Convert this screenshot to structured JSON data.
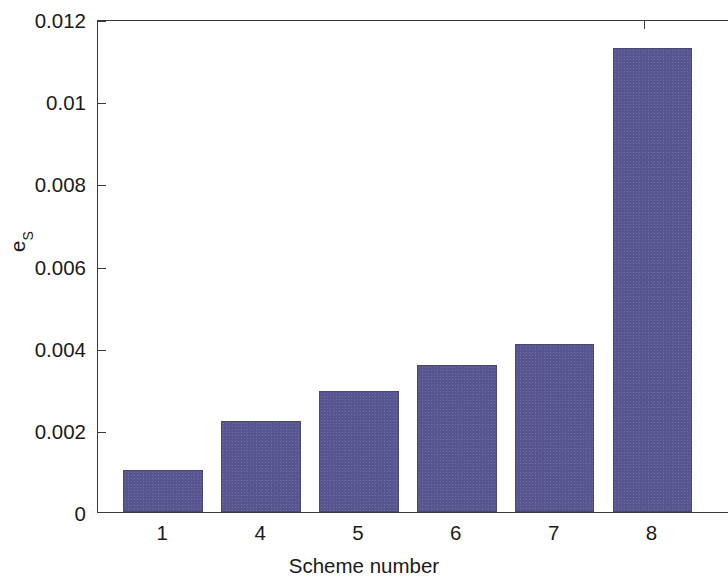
{
  "chart_data": {
    "type": "bar",
    "title": "",
    "xlabel": "Scheme number",
    "ylabel": "e_S",
    "ylabel_base": "e",
    "ylabel_sub": "S",
    "categories": [
      "1",
      "4",
      "5",
      "6",
      "7",
      "8"
    ],
    "values": [
      0.00102,
      0.00222,
      0.00294,
      0.00357,
      0.00408,
      0.01129
    ],
    "ylim": [
      0,
      0.012
    ],
    "yticks": [
      0,
      0.002,
      0.004,
      0.006,
      0.008,
      0.01,
      0.012
    ],
    "ytick_labels": [
      "0",
      "0.002",
      "0.004",
      "0.006",
      "0.008",
      "0.01",
      "0.012"
    ],
    "grid": false,
    "legend": null,
    "bar_color": "#575590",
    "axis_color": "#3a3a3a",
    "series": [
      {
        "name": "e_S",
        "values": [
          0.00102,
          0.00222,
          0.00294,
          0.00357,
          0.00408,
          0.01129
        ]
      }
    ]
  }
}
